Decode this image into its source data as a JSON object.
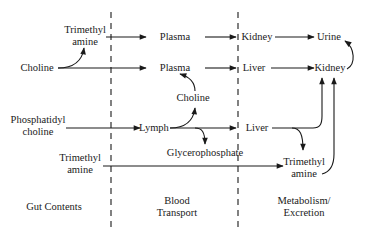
{
  "diagram": {
    "type": "flow-diagram",
    "zones": [
      {
        "label": "Gut Contents"
      },
      {
        "label_line1": "Blood",
        "label_line2": "Transport"
      },
      {
        "label_line1": "Metabolism/",
        "label_line2": "Excretion"
      }
    ],
    "nodes": {
      "tma_gut_top": {
        "line1": "Trimethyl",
        "line2": "amine"
      },
      "plasma_1": {
        "label": "Plasma"
      },
      "kidney_1": {
        "label": "Kidney"
      },
      "urine": {
        "label": "Urine"
      },
      "choline_gut": {
        "label": "Choline"
      },
      "plasma_2": {
        "label": "Plasma"
      },
      "liver_1": {
        "label": "Liver"
      },
      "kidney_2": {
        "label": "Kidney"
      },
      "choline_blood": {
        "label": "Choline"
      },
      "phosphatidylcholine": {
        "line1": "Phosphatidyl",
        "line2": "choline"
      },
      "lymph": {
        "label": "Lymph"
      },
      "liver_2": {
        "label": "Liver"
      },
      "glycerophosphate": {
        "label": "Glycerophosphate"
      },
      "tma_gut_bottom": {
        "line1": "Trimethyl",
        "line2": "amine"
      },
      "tma_metab": {
        "line1": "Trimethyl",
        "line2": "amine"
      }
    },
    "edges": [
      {
        "from": "choline_gut",
        "to": "tma_gut_top"
      },
      {
        "from": "tma_gut_top",
        "to": "plasma_1"
      },
      {
        "from": "plasma_1",
        "to": "kidney_1"
      },
      {
        "from": "kidney_1",
        "to": "urine"
      },
      {
        "from": "choline_gut",
        "to": "plasma_2"
      },
      {
        "from": "plasma_2",
        "to": "liver_1"
      },
      {
        "from": "liver_1",
        "to": "kidney_2"
      },
      {
        "from": "kidney_2",
        "to": "urine"
      },
      {
        "from": "phosphatidylcholine",
        "to": "lymph"
      },
      {
        "from": "lymph",
        "to": "choline_blood"
      },
      {
        "from": "choline_blood",
        "to": "plasma_2"
      },
      {
        "from": "lymph",
        "to": "liver_2"
      },
      {
        "from": "lymph",
        "to": "glycerophosphate"
      },
      {
        "from": "liver_2",
        "to": "kidney_2"
      },
      {
        "from": "liver_2",
        "to": "tma_metab"
      },
      {
        "from": "tma_gut_bottom",
        "to": "tma_metab"
      },
      {
        "from": "tma_metab",
        "to": "kidney_2"
      }
    ],
    "colors": {
      "line": "#1a1a1a",
      "text": "#1a1a1a",
      "background": "#ffffff"
    }
  }
}
